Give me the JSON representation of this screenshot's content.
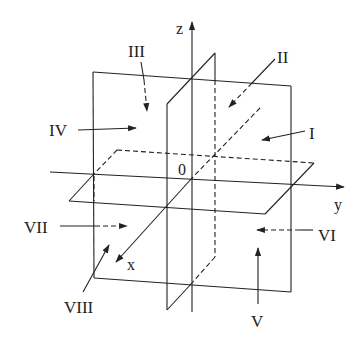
{
  "figure": {
    "type": "3d coordinate octants diagram",
    "axes": {
      "x": "x",
      "y": "y",
      "z": "z",
      "origin": "0"
    },
    "octants": [
      {
        "label": "I",
        "id": "I",
        "arrow": "solid"
      },
      {
        "label": "II",
        "id": "II",
        "arrow": "dashed"
      },
      {
        "label": "III",
        "id": "III",
        "arrow": "dashed"
      },
      {
        "label": "IV",
        "id": "IV",
        "arrow": "solid"
      },
      {
        "label": "V",
        "id": "V",
        "arrow": "solid"
      },
      {
        "label": "VI",
        "id": "VI",
        "arrow": "dashed"
      },
      {
        "label": "VII",
        "id": "VII",
        "arrow": "solid-then-dashed"
      },
      {
        "label": "VIII",
        "id": "VIII",
        "arrow": "solid"
      }
    ],
    "colors": {
      "line": "#222222",
      "background": "#ffffff"
    }
  }
}
